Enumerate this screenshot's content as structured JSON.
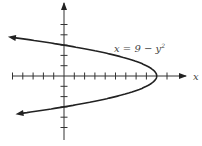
{
  "chart_data": {
    "type": "line",
    "title": "",
    "equation_label": "x = 9 − y²",
    "xlabel": "x",
    "ylabel": "",
    "xlim": [
      -6,
      10
    ],
    "ylim": [
      -6,
      7
    ],
    "grid": false,
    "legend": "none",
    "x_ticks": [
      -5,
      -4,
      -3,
      -2,
      -1,
      1,
      2,
      3,
      4,
      5,
      6,
      7,
      8,
      10
    ],
    "y_ticks": [
      -5,
      -4,
      -3,
      -2,
      -1,
      1,
      2,
      3,
      4,
      5
    ],
    "series": [
      {
        "name": "x = 9 − y²",
        "points": [
          {
            "x": -4.8,
            "y": 3.8
          },
          {
            "x": 0,
            "y": 3
          },
          {
            "x": 5,
            "y": 2
          },
          {
            "x": 8,
            "y": 1
          },
          {
            "x": 9,
            "y": 0
          },
          {
            "x": 8,
            "y": -1
          },
          {
            "x": 5,
            "y": -2
          },
          {
            "x": 0,
            "y": -3
          },
          {
            "x": -4.6,
            "y": -3.7
          }
        ],
        "vertex": {
          "x": 9,
          "y": 0
        },
        "y_intercepts": [
          3,
          -3
        ],
        "arrows": "both ends (left)"
      }
    ]
  },
  "labels": {
    "equation": "x = 9 − y",
    "exponent": "2",
    "x_axis": "x"
  }
}
